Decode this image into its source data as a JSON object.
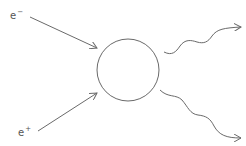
{
  "diagram": {
    "stroke_color": "#6a6a6a",
    "label_color": "#555555",
    "particles_in": [
      {
        "id": "electron",
        "symbol": "e",
        "charge": "−"
      },
      {
        "id": "positron",
        "symbol": "e",
        "charge": "+"
      }
    ],
    "vertex": {
      "shape": "circle"
    },
    "particles_out": [
      {
        "id": "photon-1",
        "line_style": "wavy"
      },
      {
        "id": "photon-2",
        "line_style": "wavy"
      }
    ]
  }
}
